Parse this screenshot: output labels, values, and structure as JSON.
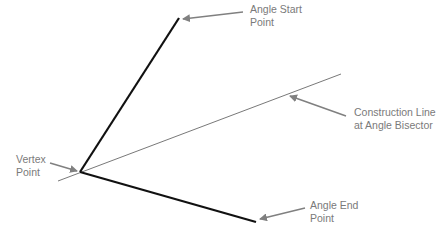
{
  "diagram": {
    "labels": {
      "angle_start": "Angle Start\nPoint",
      "construction_line": "Construction Line\nat Angle Bisector",
      "vertex": "Vertex\nPoint",
      "angle_end": "Angle End\nPoint"
    },
    "points": {
      "vertex": [
        80,
        172
      ],
      "angle_start": [
        179,
        18
      ],
      "angle_end": [
        256,
        222
      ],
      "construction_line_start": [
        58,
        181
      ],
      "construction_line_end": [
        341,
        74
      ]
    },
    "colors": {
      "angle_lines": "#111111",
      "construction_line": "#555555",
      "callouts": "#808080",
      "label_text": "#7a7a7a"
    }
  }
}
